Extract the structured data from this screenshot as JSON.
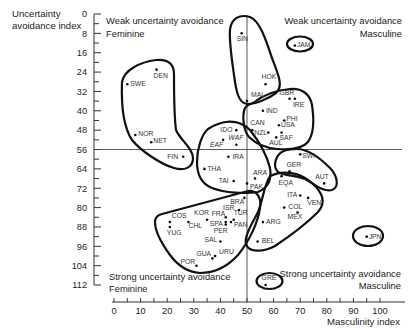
{
  "axes": {
    "y_title_line1": "Uncertainty",
    "y_title_line2": "avoidance index",
    "x_title": "Masculinity index"
  },
  "quadrants": {
    "top_left": {
      "line1": "Weak uncertainty avoidance",
      "line2": "Feminine"
    },
    "top_right": {
      "line1": "Weak uncertainty avoidance",
      "line2": "Masculine"
    },
    "bottom_left": {
      "line1": "Strong uncertainty avoidance",
      "line2": "Feminine"
    },
    "bottom_right": {
      "line1": "Strong uncertainty avoidance",
      "line2": "Masculine"
    }
  },
  "chart_data": {
    "type": "scatter",
    "title": "",
    "xlabel": "Masculinity index",
    "ylabel": "Uncertainty avoidance index",
    "xlim": [
      0,
      100
    ],
    "ylim": [
      0,
      112
    ],
    "y_inverted": true,
    "x_major_step": 10,
    "x_minor_step": 5,
    "y_major_step": 8,
    "y_minor_step": 4,
    "grid": false,
    "legend": null,
    "reference_lines": {
      "x": 50,
      "y": 56
    },
    "quadrant_labels": [
      "Weak uncertainty avoidance / Feminine",
      "Weak uncertainty avoidance / Masculine",
      "Strong uncertainty avoidance / Feminine",
      "Strong uncertainty avoidance / Masculine"
    ],
    "points": [
      {
        "label": "SIN",
        "x": 48,
        "y": 8,
        "dx": -5,
        "dy": 8
      },
      {
        "label": "JAM",
        "x": 68,
        "y": 13,
        "dx": 2,
        "dy": 2
      },
      {
        "label": "DEN",
        "x": 16,
        "y": 23,
        "dx": -3,
        "dy": 8
      },
      {
        "label": "SWE",
        "x": 5,
        "y": 29,
        "dx": 3,
        "dy": 2
      },
      {
        "label": "HOK",
        "x": 57,
        "y": 29,
        "dx": -4,
        "dy": -5
      },
      {
        "label": "MAL",
        "x": 50,
        "y": 36,
        "dx": 4,
        "dy": -4
      },
      {
        "label": "GBR",
        "x": 66,
        "y": 35,
        "dx": -10,
        "dy": -4
      },
      {
        "label": "IRE",
        "x": 68,
        "y": 35,
        "dx": -2,
        "dy": 8
      },
      {
        "label": "IND",
        "x": 56,
        "y": 40,
        "dx": 3,
        "dy": 2
      },
      {
        "label": "PHI",
        "x": 64,
        "y": 44,
        "dx": 2,
        "dy": 1
      },
      {
        "label": "USA",
        "x": 62,
        "y": 46,
        "dx": 2,
        "dy": 2
      },
      {
        "label": "CAN",
        "x": 52,
        "y": 48,
        "dx": -2,
        "dy": -5
      },
      {
        "label": "NZL",
        "x": 58,
        "y": 49,
        "dx": -14,
        "dy": 2
      },
      {
        "label": "SAF",
        "x": 63,
        "y": 49,
        "dx": -2,
        "dy": 7
      },
      {
        "label": "AUL",
        "x": 61,
        "y": 51,
        "dx": -7,
        "dy": 8
      },
      {
        "label": "IDO",
        "x": 46,
        "y": 48,
        "dx": -16,
        "dy": 2
      },
      {
        "label": "WAF",
        "x": 46,
        "y": 54,
        "dx": -8,
        "dy": -5,
        "italic": true
      },
      {
        "label": "EAF",
        "x": 41,
        "y": 52,
        "dx": -13,
        "dy": 7,
        "italic": true
      },
      {
        "label": "NOR",
        "x": 8,
        "y": 50,
        "dx": 3,
        "dy": 1
      },
      {
        "label": "NET",
        "x": 14,
        "y": 53,
        "dx": 2,
        "dy": 1
      },
      {
        "label": "FIN",
        "x": 26,
        "y": 59,
        "dx": -16,
        "dy": 2
      },
      {
        "label": "IRA",
        "x": 43,
        "y": 59,
        "dx": 4,
        "dy": 2
      },
      {
        "label": "SWI",
        "x": 70,
        "y": 58,
        "dx": 2,
        "dy": 4
      },
      {
        "label": "THA",
        "x": 34,
        "y": 64,
        "dx": 3,
        "dy": 2
      },
      {
        "label": "GER",
        "x": 66,
        "y": 65,
        "dx": -3,
        "dy": -4
      },
      {
        "label": "EQA",
        "x": 63,
        "y": 67,
        "dx": -3,
        "dy": 9
      },
      {
        "label": "ARA",
        "x": 53,
        "y": 68,
        "dx": -2,
        "dy": -4,
        "italic": true
      },
      {
        "label": "TAI",
        "x": 45,
        "y": 69,
        "dx": -15,
        "dy": 2
      },
      {
        "label": "PAK",
        "x": 50,
        "y": 70,
        "dx": 3,
        "dy": 6
      },
      {
        "label": "AUT",
        "x": 79,
        "y": 70,
        "dx": -9,
        "dy": -4
      },
      {
        "label": "ITA",
        "x": 70,
        "y": 75,
        "dx": -13,
        "dy": 1
      },
      {
        "label": "BRA",
        "x": 49,
        "y": 76,
        "dx": -14,
        "dy": 6
      },
      {
        "label": "VEN",
        "x": 73,
        "y": 76,
        "dx": -1,
        "dy": 7
      },
      {
        "label": "COL",
        "x": 64,
        "y": 80,
        "dx": 4,
        "dy": 1
      },
      {
        "label": "ISR",
        "x": 47,
        "y": 81,
        "dx": -16,
        "dy": 0
      },
      {
        "label": "MEX",
        "x": 69,
        "y": 82,
        "dx": -10,
        "dy": 7
      },
      {
        "label": "KOR",
        "x": 35,
        "y": 85,
        "dx": -13,
        "dy": -5
      },
      {
        "label": "TUR",
        "x": 45,
        "y": 85,
        "dx": 0,
        "dy": -5
      },
      {
        "label": "COS",
        "x": 21,
        "y": 86,
        "dx": 2,
        "dy": -4
      },
      {
        "label": "CHL",
        "x": 28,
        "y": 86,
        "dx": 0,
        "dy": 6
      },
      {
        "label": "FRA",
        "x": 42,
        "y": 84,
        "dx": -14,
        "dy": -1
      },
      {
        "label": "SPA",
        "x": 42,
        "y": 86,
        "dx": -16,
        "dy": 4
      },
      {
        "label": "PAN",
        "x": 44,
        "y": 86,
        "dx": 3,
        "dy": 5
      },
      {
        "label": "PER",
        "x": 42,
        "y": 87,
        "dx": -12,
        "dy": 8
      },
      {
        "label": "ARG",
        "x": 56,
        "y": 86,
        "dx": 3,
        "dy": 2
      },
      {
        "label": "YUG",
        "x": 21,
        "y": 88,
        "dx": -3,
        "dy": 8
      },
      {
        "label": "SAL",
        "x": 40,
        "y": 94,
        "dx": -16,
        "dy": 1
      },
      {
        "label": "BEL",
        "x": 54,
        "y": 94,
        "dx": 4,
        "dy": 2
      },
      {
        "label": "JPN",
        "x": 95,
        "y": 92,
        "dx": 2,
        "dy": 2
      },
      {
        "label": "URU",
        "x": 38,
        "y": 100,
        "dx": 4,
        "dy": -2
      },
      {
        "label": "GUA",
        "x": 37,
        "y": 101,
        "dx": -16,
        "dy": -2
      },
      {
        "label": "POR",
        "x": 31,
        "y": 104,
        "dx": -16,
        "dy": -2
      },
      {
        "label": "GRE",
        "x": 57,
        "y": 112,
        "dx": -4,
        "dy": -5
      }
    ],
    "clusters": [
      {
        "id": "cluster-1",
        "members": [
          "SIN",
          "HOK",
          "MAL"
        ]
      },
      {
        "id": "cluster-2",
        "members": [
          "GBR",
          "IRE",
          "IND",
          "PHI",
          "USA",
          "CAN",
          "NZL",
          "SAF",
          "AUL"
        ]
      },
      {
        "id": "cluster-3",
        "members": [
          "SWE",
          "DEN",
          "NOR",
          "NET",
          "FIN"
        ]
      },
      {
        "id": "cluster-4",
        "members": [
          "IDO",
          "WAF",
          "EAF",
          "IRA",
          "THA",
          "TAI",
          "ARA",
          "PAK"
        ]
      },
      {
        "id": "cluster-5",
        "members": [
          "SWI",
          "GER",
          "AUT"
        ]
      },
      {
        "id": "cluster-6",
        "members": [
          "EQA",
          "ITA",
          "VEN",
          "COL",
          "MEX",
          "ARG",
          "BEL"
        ]
      },
      {
        "id": "cluster-7",
        "members": [
          "BRA",
          "ISR",
          "TUR",
          "KOR",
          "FRA",
          "SPA",
          "PAN",
          "PER",
          "COS",
          "CHL",
          "YUG",
          "SAL",
          "URU",
          "GUA",
          "POR"
        ]
      },
      {
        "id": "cluster-8",
        "members": [
          "JAM"
        ]
      },
      {
        "id": "cluster-9",
        "members": [
          "JPN"
        ]
      },
      {
        "id": "cluster-10",
        "members": [
          "GRE"
        ]
      }
    ]
  }
}
